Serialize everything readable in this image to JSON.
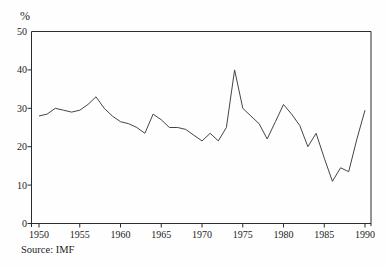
{
  "figure": {
    "unit_label": "%",
    "source": "Source: IMF"
  },
  "chart_data": {
    "type": "line",
    "title": "",
    "xlabel": "",
    "ylabel": "%",
    "source": "Source: IMF",
    "grid": false,
    "legend": "none",
    "xlim": [
      1950,
      1990
    ],
    "ylim": [
      0,
      50
    ],
    "xticks": [
      1950,
      1955,
      1960,
      1965,
      1970,
      1975,
      1980,
      1985,
      1990
    ],
    "yticks": [
      0,
      10,
      20,
      30,
      40,
      50
    ],
    "x": [
      1950,
      1951,
      1952,
      1953,
      1954,
      1955,
      1956,
      1957,
      1958,
      1959,
      1960,
      1961,
      1962,
      1963,
      1964,
      1965,
      1966,
      1967,
      1968,
      1969,
      1970,
      1971,
      1972,
      1973,
      1974,
      1975,
      1976,
      1977,
      1978,
      1979,
      1980,
      1981,
      1982,
      1983,
      1984,
      1985,
      1986,
      1987,
      1988,
      1989,
      1990
    ],
    "values": [
      28,
      28.5,
      30,
      29.5,
      29,
      29.5,
      31,
      33,
      30,
      28,
      26.5,
      26,
      25,
      23.5,
      28.5,
      27,
      25,
      25,
      24.5,
      23,
      21.5,
      23.5,
      21.5,
      25,
      40,
      30,
      28,
      26,
      22,
      26.5,
      31,
      28.5,
      25.5,
      20,
      23.5,
      17,
      11,
      14.5,
      13.5,
      22,
      29.5
    ],
    "line_color": "#454545",
    "axis_color": "#2b2b2b"
  }
}
